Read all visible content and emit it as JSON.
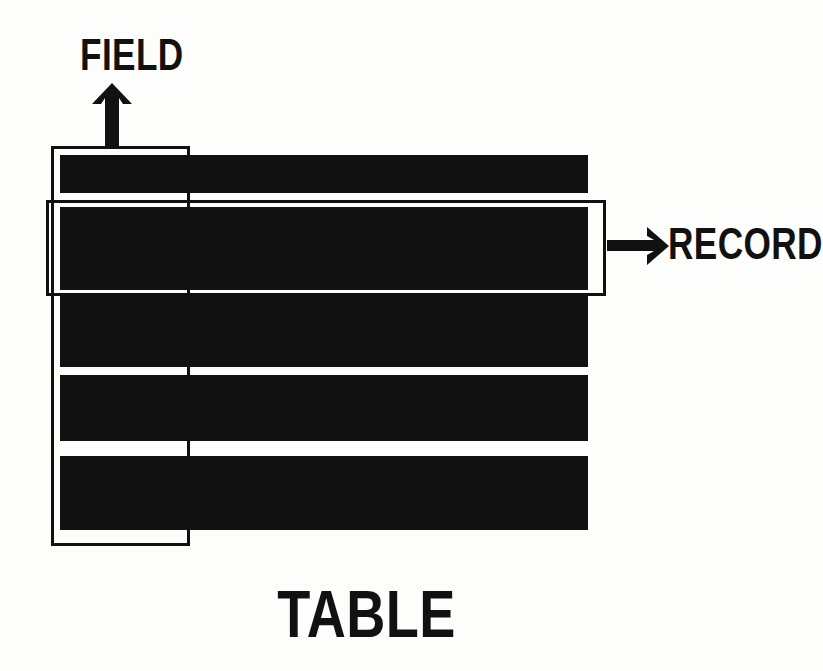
{
  "diagram": {
    "background_color": "#fdfdfb",
    "ink_color": "#111111",
    "labels": {
      "field": "FIELD",
      "record": "RECORD",
      "table": "TABLE"
    },
    "icons": {
      "field_arrow": "arrow-up-icon",
      "record_arrow": "arrow-right-icon"
    },
    "grid": {
      "columns": 4,
      "rows": 5,
      "column_x": [
        60,
        185,
        310,
        435
      ],
      "column_width": 126,
      "row_y": [
        155,
        207,
        296,
        375,
        456
      ],
      "row_height": [
        38,
        83,
        71,
        66,
        74
      ]
    },
    "highlights": {
      "field_column_outline": {
        "label": "FIELD",
        "column_index": 1,
        "x": 51,
        "y": 146,
        "width": 139,
        "height": 400
      },
      "record_row_outline": {
        "label": "RECORD",
        "row_index": 2,
        "x": 46,
        "y": 200,
        "width": 560,
        "height": 96
      }
    }
  }
}
